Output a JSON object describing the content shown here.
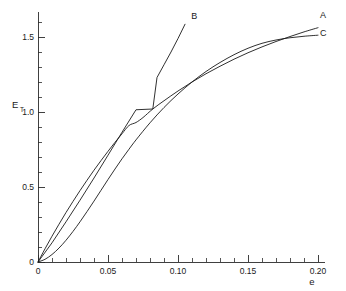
{
  "chart_data": {
    "type": "line",
    "title": "",
    "subtitle": "",
    "xlabel": "e",
    "ylabel": "E",
    "ylabel_subscript": "T",
    "ylabel_full": "E_T",
    "xlim": [
      0,
      0.205
    ],
    "ylim": [
      0,
      1.66
    ],
    "grid": false,
    "legend": "inline-end-labels",
    "x_ticks": [
      {
        "value": 0,
        "label": "0"
      },
      {
        "value": 0.05,
        "label": "0.05"
      },
      {
        "value": 0.1,
        "label": "0.10"
      },
      {
        "value": 0.15,
        "label": "0.15"
      },
      {
        "value": 0.2,
        "label": "0.20"
      }
    ],
    "y_ticks": [
      {
        "value": 0,
        "label": "0"
      },
      {
        "value": 0.5,
        "label": "0.5"
      },
      {
        "value": 1.0,
        "label": "1.0"
      },
      {
        "value": 1.5,
        "label": "1.5"
      }
    ],
    "x_minor_per_major": 5,
    "y_minor_per_major": 5,
    "series": [
      {
        "name": "A",
        "label": "A",
        "label_x": 0.2015,
        "label_y": 1.625,
        "points": [
          [
            0.0,
            0.0
          ],
          [
            0.005,
            0.088
          ],
          [
            0.01,
            0.172
          ],
          [
            0.015,
            0.252
          ],
          [
            0.02,
            0.33
          ],
          [
            0.025,
            0.404
          ],
          [
            0.03,
            0.476
          ],
          [
            0.035,
            0.545
          ],
          [
            0.04,
            0.612
          ],
          [
            0.045,
            0.676
          ],
          [
            0.05,
            0.738
          ],
          [
            0.055,
            0.798
          ],
          [
            0.06,
            0.855
          ],
          [
            0.065,
            0.91
          ],
          [
            0.07,
            0.93
          ],
          [
            0.075,
            0.963
          ],
          [
            0.082,
            1.02
          ],
          [
            0.09,
            1.075
          ],
          [
            0.1,
            1.14
          ],
          [
            0.11,
            1.2
          ],
          [
            0.12,
            1.255
          ],
          [
            0.13,
            1.305
          ],
          [
            0.14,
            1.352
          ],
          [
            0.15,
            1.395
          ],
          [
            0.16,
            1.434
          ],
          [
            0.17,
            1.47
          ],
          [
            0.18,
            1.503
          ],
          [
            0.19,
            1.534
          ],
          [
            0.2,
            1.562
          ]
        ]
      },
      {
        "name": "B",
        "label": "B",
        "label_x": 0.1095,
        "label_y": 1.62,
        "points": [
          [
            0.0,
            0.0
          ],
          [
            0.01,
            0.128
          ],
          [
            0.02,
            0.268
          ],
          [
            0.03,
            0.412
          ],
          [
            0.04,
            0.56
          ],
          [
            0.05,
            0.712
          ],
          [
            0.06,
            0.865
          ],
          [
            0.07,
            1.015
          ],
          [
            0.082,
            1.02
          ],
          [
            0.085,
            1.23
          ],
          [
            0.09,
            1.315
          ],
          [
            0.095,
            1.4
          ],
          [
            0.1,
            1.49
          ],
          [
            0.105,
            1.585
          ]
        ]
      },
      {
        "name": "C",
        "label": "C",
        "label_x": 0.2015,
        "label_y": 1.505,
        "points": [
          [
            0.0,
            0.0
          ],
          [
            0.005,
            0.018
          ],
          [
            0.01,
            0.05
          ],
          [
            0.015,
            0.093
          ],
          [
            0.02,
            0.145
          ],
          [
            0.025,
            0.204
          ],
          [
            0.03,
            0.268
          ],
          [
            0.035,
            0.336
          ],
          [
            0.04,
            0.406
          ],
          [
            0.045,
            0.478
          ],
          [
            0.05,
            0.55
          ],
          [
            0.055,
            0.62
          ],
          [
            0.06,
            0.688
          ],
          [
            0.065,
            0.752
          ],
          [
            0.07,
            0.814
          ],
          [
            0.08,
            0.928
          ],
          [
            0.09,
            1.03
          ],
          [
            0.1,
            1.12
          ],
          [
            0.11,
            1.2
          ],
          [
            0.12,
            1.27
          ],
          [
            0.13,
            1.33
          ],
          [
            0.14,
            1.382
          ],
          [
            0.15,
            1.425
          ],
          [
            0.16,
            1.458
          ],
          [
            0.17,
            1.48
          ],
          [
            0.18,
            1.495
          ],
          [
            0.19,
            1.505
          ],
          [
            0.2,
            1.512
          ]
        ]
      }
    ],
    "annotations": [
      {
        "name": "crossing-point",
        "x": 0.082,
        "y": 1.02,
        "text": ""
      }
    ],
    "colors": {
      "curve": "#1a1a1a",
      "axis": "#2b2b2b",
      "background": "#ffffff",
      "text": "#1a1a1a"
    }
  }
}
